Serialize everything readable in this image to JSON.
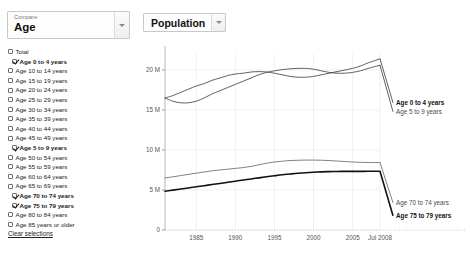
{
  "left_panel": {
    "compare": {
      "caption": "Compare",
      "value": "Age",
      "arrow_icon": "chevron-down-icon"
    },
    "facets": [
      {
        "label": "Total",
        "checked": false
      },
      {
        "label": "Age 0 to 4 years",
        "checked": true
      },
      {
        "label": "Age 10 to 14 years",
        "checked": false
      },
      {
        "label": "Age 15 to 19 years",
        "checked": false
      },
      {
        "label": "Age 20 to 24 years",
        "checked": false
      },
      {
        "label": "Age 25 to 29 years",
        "checked": false
      },
      {
        "label": "Age 30 to 34 years",
        "checked": false
      },
      {
        "label": "Age 35 to 39 years",
        "checked": false
      },
      {
        "label": "Age 40 to 44 years",
        "checked": false
      },
      {
        "label": "Age 45 to 49 years",
        "checked": false
      },
      {
        "label": "Age 5 to 9 years",
        "checked": true
      },
      {
        "label": "Age 50 to 54 years",
        "checked": false
      },
      {
        "label": "Age 55 to 59 years",
        "checked": false
      },
      {
        "label": "Age 60 to 64 years",
        "checked": false
      },
      {
        "label": "Age 65 to 69 years",
        "checked": false
      },
      {
        "label": "Age 70 to 74 years",
        "checked": true
      },
      {
        "label": "Age 75 to 79 years",
        "checked": true
      },
      {
        "label": "Age 80 to 84 years",
        "checked": false
      },
      {
        "label": "Age 85 years or older",
        "checked": false
      }
    ],
    "clear_selections": "Clear selections"
  },
  "chart_panel": {
    "metric": {
      "value": "Population",
      "arrow_icon": "chevron-down-icon"
    }
  },
  "chart_data": {
    "type": "line",
    "title": "Population",
    "xlabel": "",
    "ylabel": "Population",
    "grid": true,
    "legend_position": "right-inline",
    "xlim": [
      1981,
      2008.5
    ],
    "ylim": [
      0,
      22000000
    ],
    "x_ticks": [
      "1985",
      "1990",
      "1995",
      "2000",
      "2005",
      "Jul 2008"
    ],
    "x_tick_values": [
      1985,
      1990,
      1995,
      2000,
      2005,
      2008.5
    ],
    "y_ticks": [
      "0",
      "5 M",
      "10 M",
      "15 M",
      "20 M"
    ],
    "y_tick_values": [
      0,
      5000000,
      10000000,
      15000000,
      20000000
    ],
    "x": [
      1981,
      1982,
      1983,
      1984,
      1985,
      1986,
      1987,
      1988,
      1989,
      1990,
      1991,
      1992,
      1993,
      1994,
      1995,
      1996,
      1997,
      1998,
      1999,
      2000,
      2001,
      2002,
      2003,
      2004,
      2005,
      2006,
      2007,
      2008.5
    ],
    "series": [
      {
        "name": "Age 0 to 4 years",
        "style": "thin",
        "color": "#444444",
        "label_weight": "bold",
        "values": [
          16500000,
          16800000,
          17200000,
          17600000,
          18000000,
          18300000,
          18700000,
          19000000,
          19300000,
          19500000,
          19600000,
          19750000,
          19800000,
          19750000,
          19600000,
          19400000,
          19200000,
          19100000,
          19100000,
          19200000,
          19400000,
          19600000,
          19800000,
          20000000,
          20200000,
          20500000,
          20900000,
          21400000
        ]
      },
      {
        "name": "Age 5 to 9 years",
        "style": "thin",
        "color": "#444444",
        "label_weight": "normal",
        "values": [
          16500000,
          16100000,
          15900000,
          15900000,
          16100000,
          16500000,
          17000000,
          17400000,
          17800000,
          18200000,
          18600000,
          19000000,
          19400000,
          19700000,
          19900000,
          20050000,
          20150000,
          20200000,
          20200000,
          20100000,
          19900000,
          19700000,
          19600000,
          19600000,
          19700000,
          19900000,
          20200000,
          20600000
        ]
      },
      {
        "name": "Age 70 to 74 years",
        "style": "thin",
        "color": "#6a6a6a",
        "label_weight": "normal",
        "values": [
          6500000,
          6650000,
          6800000,
          6950000,
          7100000,
          7250000,
          7400000,
          7500000,
          7600000,
          7700000,
          7800000,
          7950000,
          8150000,
          8350000,
          8500000,
          8600000,
          8680000,
          8720000,
          8740000,
          8740000,
          8720000,
          8680000,
          8620000,
          8560000,
          8500000,
          8460000,
          8440000,
          8430000
        ]
      },
      {
        "name": "Age 75 to 79 years",
        "style": "bold",
        "color": "#111111",
        "label_weight": "bold",
        "values": [
          4850000,
          4980000,
          5120000,
          5260000,
          5400000,
          5540000,
          5680000,
          5820000,
          5960000,
          6100000,
          6240000,
          6380000,
          6520000,
          6650000,
          6780000,
          6900000,
          7000000,
          7090000,
          7160000,
          7220000,
          7270000,
          7300000,
          7320000,
          7330000,
          7330000,
          7330000,
          7340000,
          7350000
        ]
      }
    ]
  }
}
